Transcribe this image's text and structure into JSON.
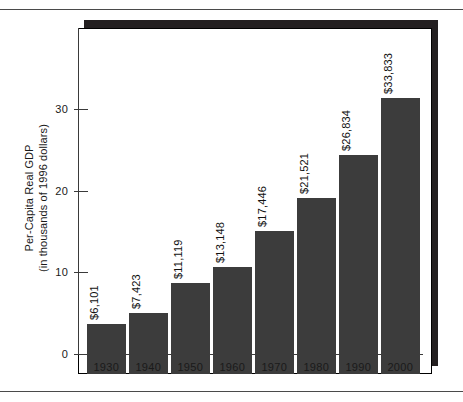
{
  "chart_data": {
    "type": "bar",
    "title": "",
    "subtitle": "",
    "xlabel": "",
    "ylabel_line1": "Per-Capita Real GDP",
    "ylabel_line2": "(in thousands of 1996 dollars)",
    "categories": [
      "1930",
      "1940",
      "1950",
      "1960",
      "1970",
      "1980",
      "1990",
      "2000"
    ],
    "values": [
      6.101,
      7.423,
      11.119,
      13.148,
      17.446,
      21.521,
      26.834,
      33.833
    ],
    "value_labels": [
      "$6,101",
      "$7,423",
      "$11,119",
      "$13,148",
      "$17,446",
      "$21,521",
      "$26,834",
      "$33,833"
    ],
    "ylim": [
      0,
      39.9
    ],
    "yticks": [
      0,
      10,
      20,
      30
    ],
    "ytick_labels": [
      "0",
      "10",
      "20",
      "30"
    ],
    "grid": false,
    "legend": false,
    "legend_position": "none",
    "bar_color": "#3c3c3c",
    "axis_color": "#3a3a3a",
    "frame_shadow_color": "#231f20",
    "background_color": "#ffffff"
  }
}
